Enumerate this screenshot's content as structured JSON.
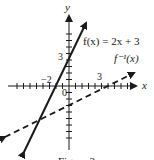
{
  "figure": {
    "caption": "Figure 3",
    "axes": {
      "x_label": "x",
      "y_label": "y",
      "origin_label": "0",
      "x_tick_labels": [
        {
          "value": -2,
          "text": "−2"
        },
        {
          "value": 3,
          "text": "3"
        }
      ],
      "y_tick_labels": [
        {
          "value": 3,
          "text": "3"
        }
      ]
    },
    "curves": [
      {
        "name": "f",
        "label": "f(x) = 2x + 3",
        "style": "solid",
        "equation": "y = 2x + 3"
      },
      {
        "name": "f_inverse",
        "label": "f⁻¹(x)",
        "style": "dashed",
        "equation": "y = (x - 3) / 2"
      }
    ],
    "colors": {
      "line": "#1a1a1a",
      "background": "#ffffff"
    }
  }
}
